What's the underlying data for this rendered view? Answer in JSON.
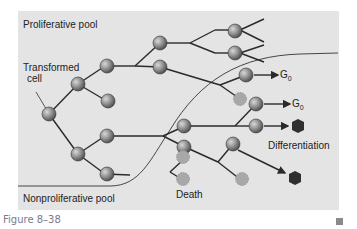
{
  "labels": {
    "proliferative_pool": "Proliferative pool",
    "transformed_cell_line1": "Transformed",
    "transformed_cell_line2": "cell",
    "nonproliferative_pool": "Nonproliferative pool",
    "g0_a_main": "G",
    "g0_a_sub": "0",
    "g0_b_main": "G",
    "g0_b_sub": "0",
    "differentiation": "Differentiation",
    "death": "Death"
  },
  "caption": "Figure 8–38",
  "colors": {
    "panel_bg": "#e4e4e4",
    "line": "#2a2a2a",
    "live_cell": "#8c8c8c",
    "dead_cell": "#a8a8a8",
    "differentiated_cell": "#2f2f2f",
    "caption": "#7a7a8a"
  }
}
